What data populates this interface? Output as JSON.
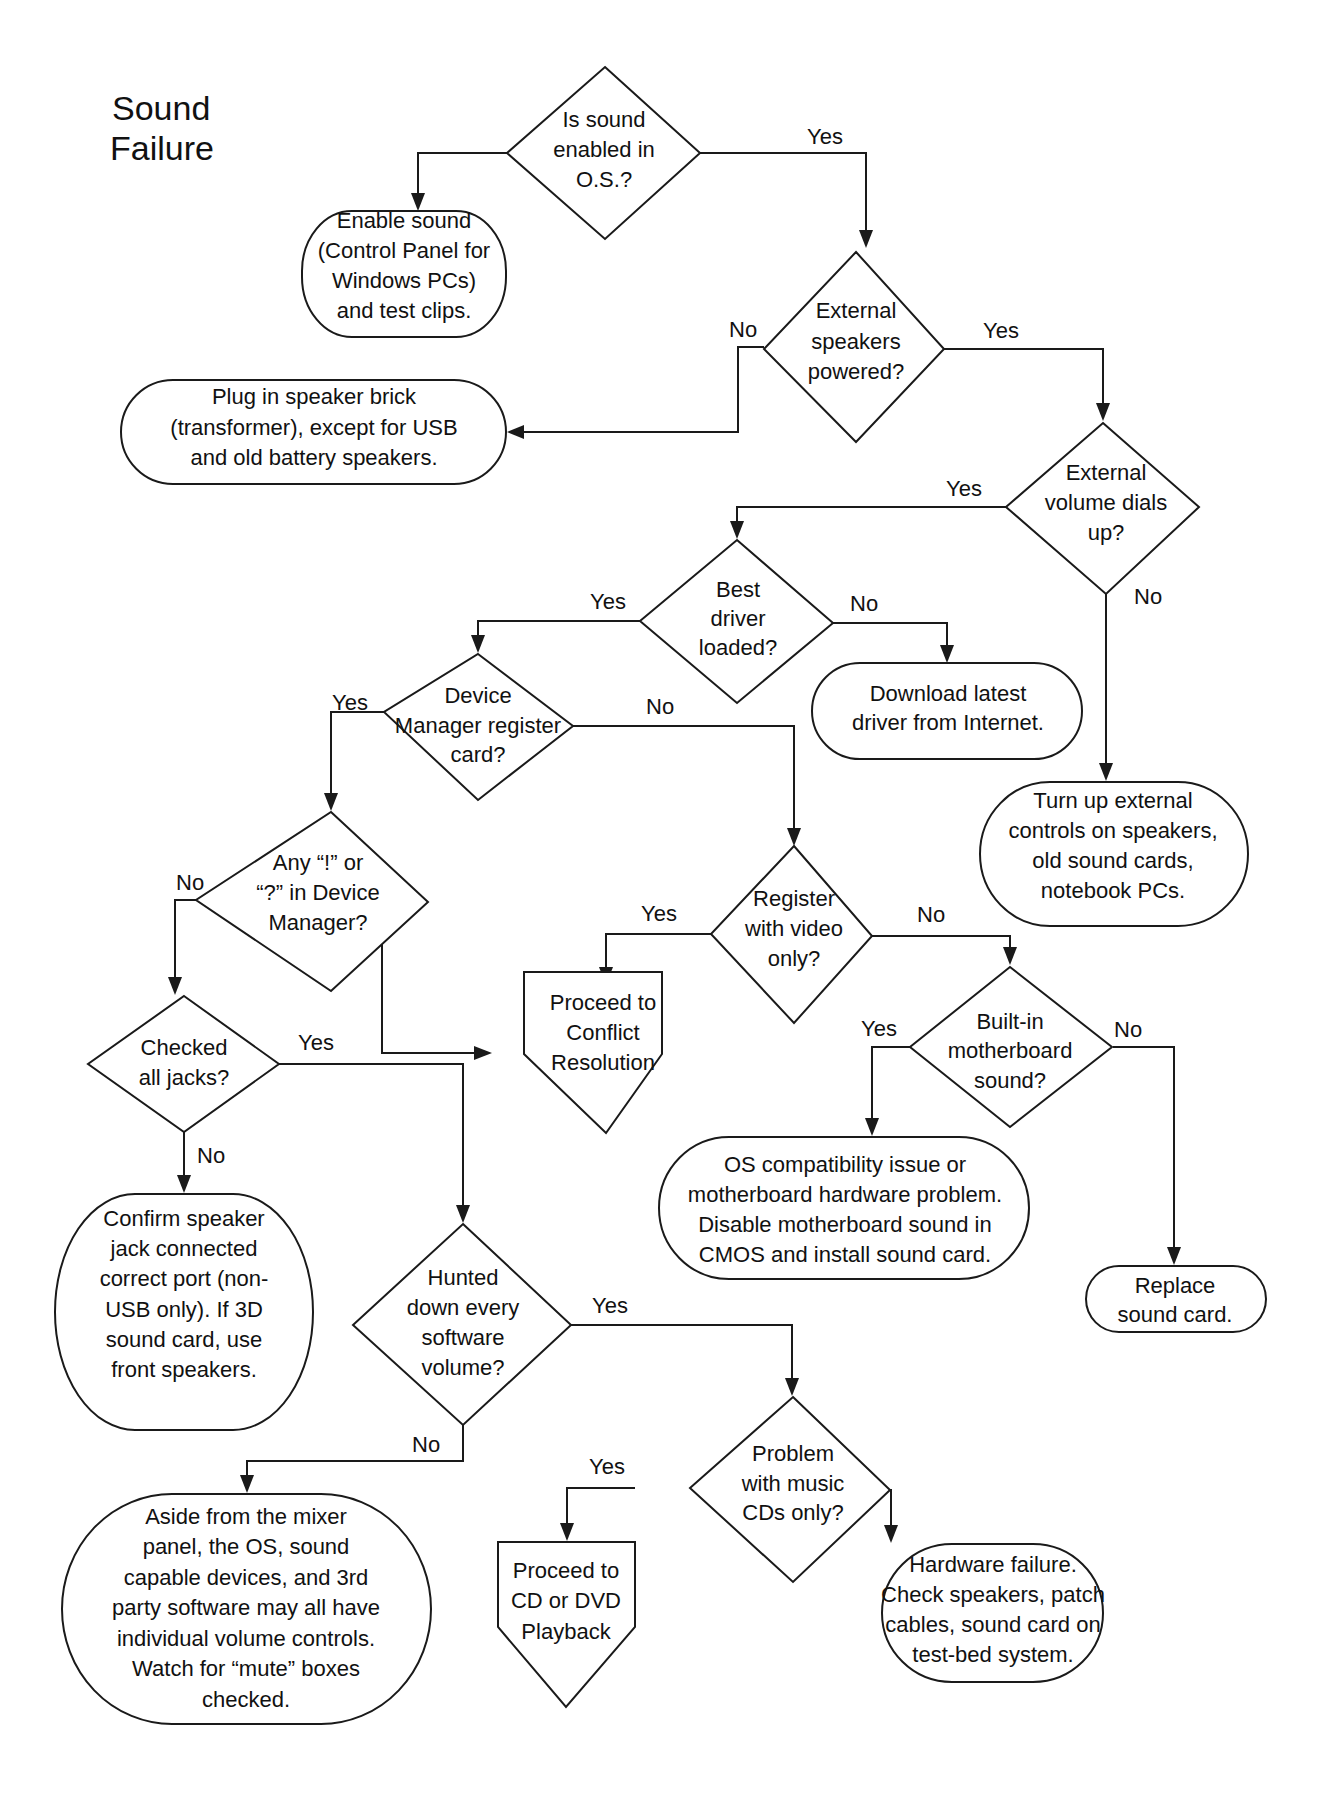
{
  "diagram": {
    "title": [
      "Sound",
      "Failure"
    ],
    "nodes": {
      "d1": {
        "type": "decision",
        "lines": [
          "Is sound",
          "enabled in",
          "O.S.?"
        ]
      },
      "t1": {
        "type": "terminal",
        "lines": [
          "Enable sound",
          "(Control Panel for",
          "Windows PCs)",
          "and test clips."
        ]
      },
      "d2": {
        "type": "decision",
        "lines": [
          "External",
          "speakers",
          "powered?"
        ]
      },
      "t2": {
        "type": "terminal",
        "lines": [
          "Plug in speaker brick",
          "(transformer), except for USB",
          "and old battery speakers."
        ]
      },
      "d3": {
        "type": "decision",
        "lines": [
          "External",
          "volume dials",
          "up?"
        ]
      },
      "d4": {
        "type": "decision",
        "lines": [
          "Best",
          "driver",
          "loaded?"
        ]
      },
      "t3": {
        "type": "terminal",
        "lines": [
          "Download latest",
          "driver from Internet."
        ]
      },
      "t4": {
        "type": "terminal",
        "lines": [
          "Turn up external",
          "controls on speakers,",
          "old sound cards,",
          "notebook PCs."
        ]
      },
      "d5": {
        "type": "decision",
        "lines": [
          "Device",
          "Manager register",
          "card?"
        ]
      },
      "d6": {
        "type": "decision",
        "lines": [
          "Any “!” or",
          "“?” in Device",
          "Manager?"
        ]
      },
      "d7": {
        "type": "decision",
        "lines": [
          "Register",
          "with video",
          "only?"
        ]
      },
      "p1": {
        "type": "offpage",
        "lines": [
          "Proceed to",
          "Conflict",
          "Resolution"
        ]
      },
      "d8": {
        "type": "decision",
        "lines": [
          "Built-in",
          "motherboard",
          "sound?"
        ]
      },
      "d9": {
        "type": "decision",
        "lines": [
          "Checked",
          "all jacks?"
        ]
      },
      "t5": {
        "type": "terminal",
        "lines": [
          "OS compatibility issue or",
          "motherboard hardware problem.",
          "Disable motherboard sound in",
          "CMOS  and install sound card."
        ]
      },
      "t6": {
        "type": "terminal",
        "lines": [
          "Confirm speaker",
          "jack connected",
          "correct port (non-",
          "USB only). If 3D",
          "sound card, use",
          "front speakers."
        ]
      },
      "t7": {
        "type": "terminal",
        "lines": [
          "Replace",
          "sound card."
        ]
      },
      "d10": {
        "type": "decision",
        "lines": [
          "Hunted",
          "down every",
          "software",
          "volume?"
        ]
      },
      "d11": {
        "type": "decision",
        "lines": [
          "Problem",
          "with music",
          "CDs only?"
        ]
      },
      "t8": {
        "type": "terminal",
        "lines": [
          "Aside from the mixer",
          "panel, the OS, sound",
          "capable devices, and 3rd",
          "party software may all have",
          "individual volume controls.",
          "Watch for “mute” boxes",
          "checked."
        ]
      },
      "p2": {
        "type": "offpage",
        "lines": [
          "Proceed to",
          "CD or DVD",
          "Playback"
        ]
      },
      "t9": {
        "type": "terminal",
        "lines": [
          "Hardware failure.",
          "Check speakers, patch",
          "cables, sound card on",
          "test-bed system."
        ]
      }
    },
    "edges": [
      {
        "from": "d1",
        "to": "t1",
        "label": "No"
      },
      {
        "from": "d1",
        "to": "d2",
        "label": "Yes"
      },
      {
        "from": "d2",
        "to": "t2",
        "label": "No"
      },
      {
        "from": "d2",
        "to": "d3",
        "label": "Yes"
      },
      {
        "from": "d3",
        "to": "d4",
        "label": "Yes"
      },
      {
        "from": "d3",
        "to": "t4",
        "label": "No"
      },
      {
        "from": "d4",
        "to": "d5",
        "label": "Yes"
      },
      {
        "from": "d4",
        "to": "t3",
        "label": "No"
      },
      {
        "from": "d5",
        "to": "d6",
        "label": "Yes"
      },
      {
        "from": "d5",
        "to": "d7",
        "label": "No"
      },
      {
        "from": "d6",
        "to": "d9",
        "label": "No"
      },
      {
        "from": "d6",
        "to": "p1",
        "label": "Yes"
      },
      {
        "from": "d7",
        "to": "p1",
        "label": "Yes"
      },
      {
        "from": "d7",
        "to": "d8",
        "label": "No"
      },
      {
        "from": "d8",
        "to": "t5",
        "label": "Yes"
      },
      {
        "from": "d8",
        "to": "t7",
        "label": "No"
      },
      {
        "from": "d9",
        "to": "d10",
        "label": "Yes"
      },
      {
        "from": "d9",
        "to": "t6",
        "label": "No"
      },
      {
        "from": "d10",
        "to": "d11",
        "label": "Yes"
      },
      {
        "from": "d10",
        "to": "t8",
        "label": "No"
      },
      {
        "from": "d11",
        "to": "p2",
        "label": "Yes"
      },
      {
        "from": "d11",
        "to": "t9",
        "label": "No"
      }
    ],
    "labels": {
      "yes": "Yes",
      "no": "No"
    }
  }
}
